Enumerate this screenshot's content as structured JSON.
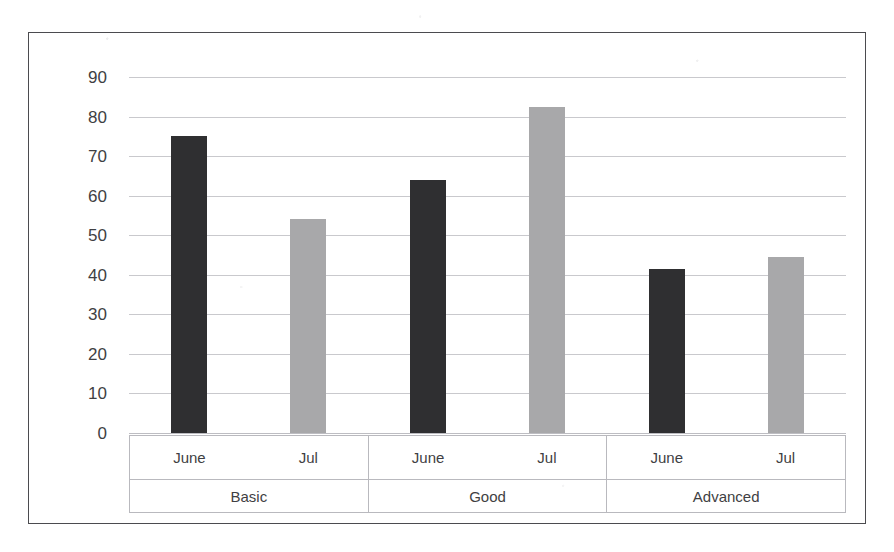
{
  "chart_data": {
    "type": "bar",
    "title": "",
    "xlabel": "",
    "ylabel": "",
    "ylim": [
      0,
      90
    ],
    "ytick_step": 10,
    "yticks": [
      90,
      80,
      70,
      60,
      50,
      40,
      30,
      20,
      10,
      0
    ],
    "grid": true,
    "legend": false,
    "legend_position": "none",
    "categories": [
      "Basic",
      "Good",
      "Advanced"
    ],
    "subcategories": [
      "June",
      "Jul"
    ],
    "series": [
      {
        "name": "June",
        "color": "#2f2f31",
        "values": [
          75,
          64,
          41.5
        ]
      },
      {
        "name": "Jul",
        "color": "#a8a8aa",
        "values": [
          54,
          82.5,
          44.5
        ]
      }
    ],
    "bars": [
      {
        "group": "Basic",
        "sub": "June",
        "value": 75,
        "series": "June"
      },
      {
        "group": "Basic",
        "sub": "Jul",
        "value": 54,
        "series": "Jul"
      },
      {
        "group": "Good",
        "sub": "June",
        "value": 64,
        "series": "June"
      },
      {
        "group": "Good",
        "sub": "Jul",
        "value": 82.5,
        "series": "Jul"
      },
      {
        "group": "Advanced",
        "sub": "June",
        "value": 41.5,
        "series": "June"
      },
      {
        "group": "Advanced",
        "sub": "Jul",
        "value": 44.5,
        "series": "Jul"
      }
    ]
  },
  "axis": {
    "y_labels": [
      "90",
      "80",
      "70",
      "60",
      "50",
      "40",
      "30",
      "20",
      "10",
      "0"
    ],
    "groups": [
      {
        "label": "Basic",
        "months": [
          "June",
          "Jul"
        ]
      },
      {
        "label": "Good",
        "months": [
          "June",
          "Jul"
        ]
      },
      {
        "label": "Advanced",
        "months": [
          "June",
          "Jul"
        ]
      }
    ]
  },
  "colors": {
    "bar_dark": "#2f2f31",
    "bar_light": "#a8a8aa",
    "gridline": "#c9c9cd",
    "frame_border": "#4b4b4f",
    "text": "#3f3f43",
    "background": "#ffffff"
  }
}
